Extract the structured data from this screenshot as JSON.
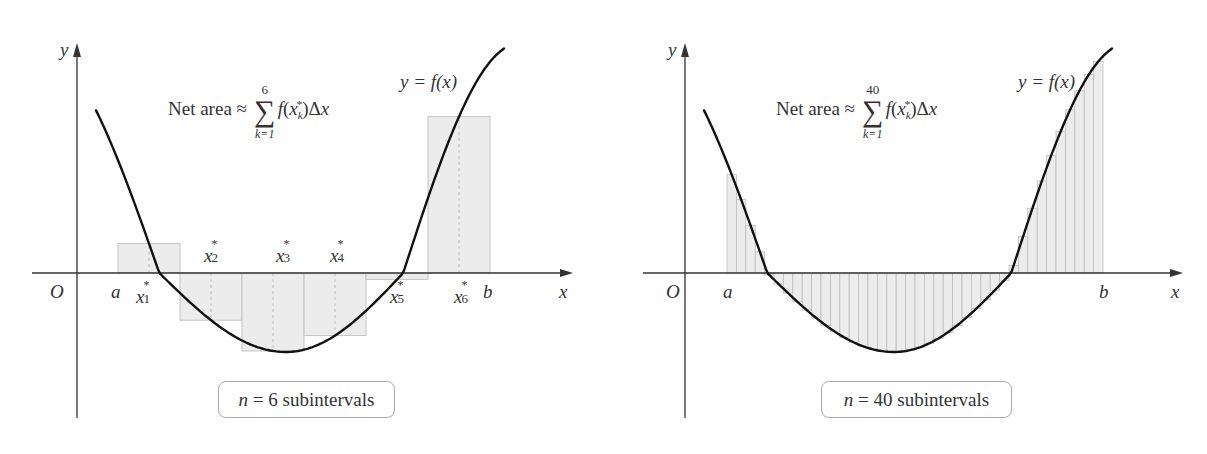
{
  "chart_data": [
    {
      "type": "bar",
      "title": "Net area ≈ Σ_{k=1}^{6} f(x_k*) Δx",
      "subtitle": "Riemann sum approximation with midpoint sample points",
      "curve_label": "y = f(x)",
      "xlabel": "x",
      "ylabel": "y",
      "n": 6,
      "box_label": "6 subintervals",
      "tick_labels": [
        "O",
        "a",
        "x1*",
        "x2*",
        "x3*",
        "x4*",
        "x5*",
        "x6*",
        "b"
      ],
      "categories": [
        "x1*",
        "x2*",
        "x3*",
        "x4*",
        "x5*",
        "x6*"
      ],
      "values": [
        3.0,
        -0.8,
        -2.6,
        -1.8,
        1.2,
        5.0
      ],
      "grid": false,
      "legend": "none"
    },
    {
      "type": "bar",
      "title": "Net area ≈ Σ_{k=1}^{40} f(x_k*) Δx",
      "curve_label": "y = f(x)",
      "xlabel": "x",
      "ylabel": "y",
      "n": 40,
      "box_label": "40 subintervals",
      "tick_labels": [
        "O",
        "a",
        "b"
      ],
      "grid": false,
      "legend": "none"
    }
  ],
  "left": {
    "title_prefix": "Net area ≈",
    "sum_upper": "6",
    "sum_lower": "k=1",
    "curve_label": "y = f(x)",
    "axis_y": "y",
    "axis_x": "x",
    "origin": "O",
    "a": "a",
    "b": "b",
    "n_var": "n",
    "n_eq": " = 6 subintervals",
    "sample_labels": [
      {
        "base": "x",
        "sub": "1",
        "x": 136,
        "y": 284
      },
      {
        "base": "x",
        "sub": "2",
        "x": 204,
        "y": 243
      },
      {
        "base": "x",
        "sub": "3",
        "x": 276,
        "y": 243
      },
      {
        "base": "x",
        "sub": "4",
        "x": 330,
        "y": 243
      },
      {
        "base": "x",
        "sub": "5",
        "x": 390,
        "y": 284
      },
      {
        "base": "x",
        "sub": "6",
        "x": 454,
        "y": 284
      }
    ]
  },
  "right": {
    "title_prefix": "Net area ≈",
    "sum_upper": "40",
    "sum_lower": "k=1",
    "curve_label": "y = f(x)",
    "axis_y": "y",
    "axis_x": "x",
    "origin": "O",
    "a": "a",
    "b": "b",
    "n_var": "n",
    "n_eq": " = 40 subintervals"
  },
  "colors": {
    "curve": "#111111",
    "axis": "#333333",
    "rect_fill": "#ececec",
    "rect_stroke": "#c4c4c4",
    "strip_line": "#bdbdbd"
  }
}
